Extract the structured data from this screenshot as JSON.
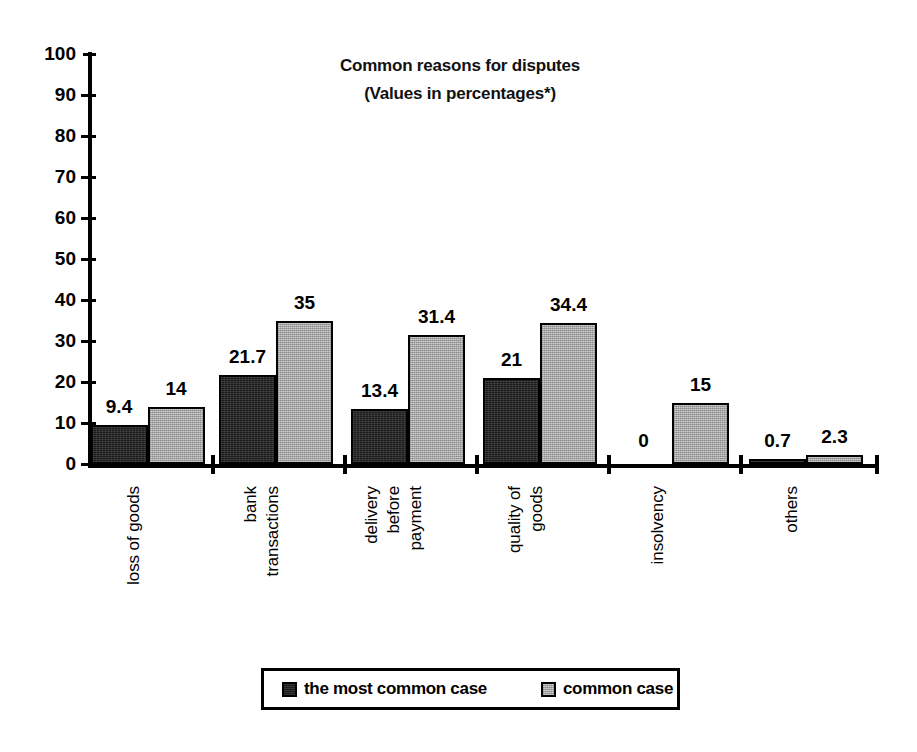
{
  "chart_data": {
    "type": "bar",
    "title": "Common reasons for disputes",
    "subtitle": "(Values in percentages*)",
    "xlabel": "",
    "ylabel": "",
    "ylim": [
      0,
      100
    ],
    "yticks": [
      0,
      10,
      20,
      30,
      40,
      50,
      60,
      70,
      80,
      90,
      100
    ],
    "grid": false,
    "legend_position": "bottom",
    "categories": [
      "loss of goods",
      "bank transactions",
      "delivery before payment",
      "quality of goods",
      "insolvency",
      "others"
    ],
    "category_lines": [
      [
        "loss of goods"
      ],
      [
        "bank",
        "transactions"
      ],
      [
        "delivery",
        "before",
        "payment"
      ],
      [
        "quality of",
        "goods"
      ],
      [
        "insolvency"
      ],
      [
        "others"
      ]
    ],
    "series": [
      {
        "name": "the most common case",
        "color": "#1c1c1c",
        "values": [
          9.4,
          21.7,
          13.4,
          21,
          0,
          0.7
        ],
        "labels": [
          "9.4",
          "21.7",
          "13.4",
          "21",
          "0",
          "0.7"
        ]
      },
      {
        "name": "common case",
        "color": "#a6a6a6",
        "values": [
          14,
          35,
          31.4,
          34.4,
          15,
          2.3
        ],
        "labels": [
          "14",
          "35",
          "31.4",
          "34.4",
          "15",
          "2.3"
        ]
      }
    ]
  },
  "axis": {
    "tick_labels": [
      "100",
      "90",
      "80",
      "70",
      "60",
      "50",
      "40",
      "30",
      "20",
      "10",
      "0"
    ]
  },
  "legend": {
    "items": [
      {
        "label": "the most common case",
        "swatch": "dark-swatch-icon"
      },
      {
        "label": "common case",
        "swatch": "light-swatch-icon"
      }
    ]
  }
}
